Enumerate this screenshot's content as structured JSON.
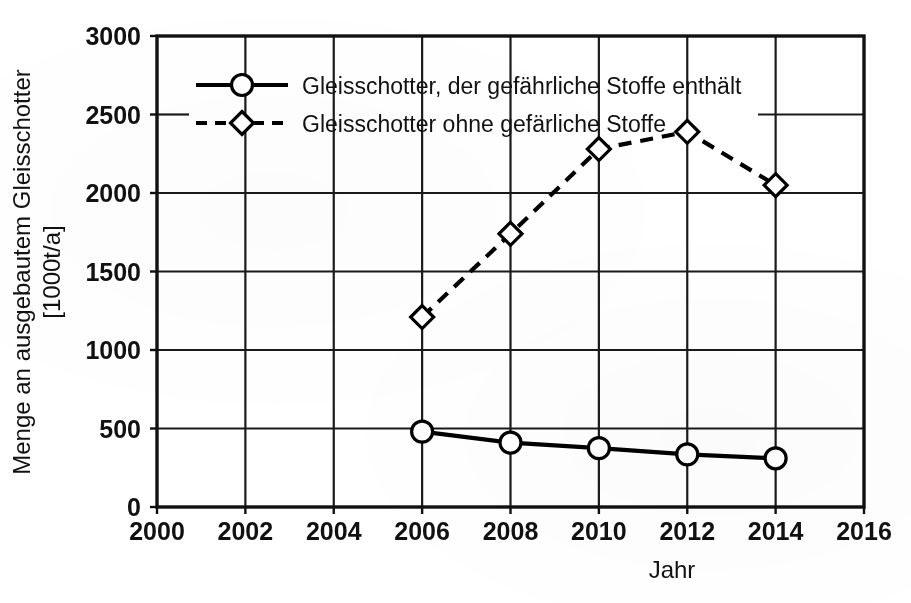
{
  "chart_data": {
    "type": "line",
    "title": "",
    "xlabel": "Jahr",
    "ylabel": "Menge an ausgebautem Gleisschotter [1000t/a]",
    "ylabel_line1": "Menge an ausgebautem Gleisschotter",
    "ylabel_line2": "[1000t/a]",
    "xlim": [
      2000,
      2016
    ],
    "ylim": [
      0,
      3000
    ],
    "xticks": [
      2000,
      2002,
      2004,
      2006,
      2008,
      2010,
      2012,
      2014,
      2016
    ],
    "xtick_labels": [
      "2000",
      "2002",
      "2004",
      "2006",
      "2008",
      "2010",
      "2012",
      "2014",
      "2016"
    ],
    "yticks": [
      0,
      500,
      1000,
      1500,
      2000,
      2500,
      3000
    ],
    "ytick_labels": [
      "0",
      "500",
      "1000",
      "1500",
      "2000",
      "2500",
      "3000"
    ],
    "grid": true,
    "grid_note": "horizontal gridline at 2500 is interrupted behind the legend box",
    "legend_position": "upper-left-inside",
    "x": [
      2006,
      2008,
      2010,
      2012,
      2014
    ],
    "series": [
      {
        "name": "Gleisschotter, der gefährliche Stoffe enthält",
        "values": [
          480,
          410,
          375,
          335,
          310
        ],
        "marker": "circle",
        "linestyle": "solid",
        "color": "#000000"
      },
      {
        "name": "Gleisschotter ohne gefärliche Stoffe",
        "values": [
          1210,
          1740,
          2280,
          2390,
          2050
        ],
        "marker": "diamond",
        "linestyle": "dashed",
        "color": "#000000"
      }
    ]
  },
  "legend": {
    "items": [
      {
        "label": "Gleisschotter, der gefährliche Stoffe enthält",
        "marker": "circle",
        "linestyle": "solid"
      },
      {
        "label": "Gleisschotter ohne gefärliche Stoffe",
        "marker": "diamond",
        "linestyle": "dashed"
      }
    ]
  },
  "colors": {
    "ink": "#111111",
    "line": "#000000",
    "grid": "#1a1a1a",
    "paper": "#ffffff"
  }
}
